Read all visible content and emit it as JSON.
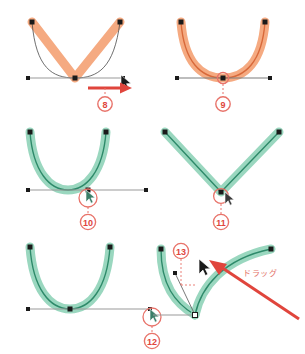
{
  "figure": {
    "background": "#ffffff",
    "colors": {
      "curve_orange": "#f4a57a",
      "curve_orange_stroke": "#e8773c",
      "curve_green": "#6fc4a3",
      "curve_green_stroke": "#2e8a6a",
      "accent_red": "#e0453c",
      "marker_red": "#e8736a",
      "axis_gray": "#9a9a9a",
      "anchor_black": "#1a1a1a"
    },
    "labels": {
      "drag_text": "ドラッグ"
    },
    "panels": [
      {
        "id": "panel-8",
        "step_number": "8",
        "curve_color": "orange",
        "shape": "v-corner",
        "has_arrow": true,
        "arrow_direction": "right",
        "has_cursor": true,
        "description": "corner point with horizontal drag arrow"
      },
      {
        "id": "panel-9",
        "step_number": "9",
        "curve_color": "orange",
        "shape": "u-smooth",
        "has_arrow": false,
        "has_cursor": false,
        "description": "smoothed U curve, anchor highlighted"
      },
      {
        "id": "panel-10",
        "step_number": "10",
        "curve_color": "green",
        "shape": "u-smooth",
        "has_arrow": false,
        "has_cursor": true,
        "description": "green U curve, anchor selected with cursor"
      },
      {
        "id": "panel-11",
        "step_number": "11",
        "curve_color": "green",
        "shape": "v-corner",
        "has_arrow": false,
        "has_cursor": true,
        "description": "green V corner, anchor converted"
      },
      {
        "id": "panel-12",
        "step_number": "12",
        "curve_color": "green",
        "shape": "u-smooth",
        "has_arrow": false,
        "has_cursor": true,
        "description": "green U curve, cursor at right anchor"
      },
      {
        "id": "panel-13",
        "step_number": "13",
        "curve_color": "green",
        "shape": "asymmetric-drag",
        "has_arrow": true,
        "arrow_direction": "up-left",
        "has_cursor": true,
        "annotation": "ドラッグ",
        "description": "dragging handle up-left to reshape curve"
      }
    ]
  }
}
